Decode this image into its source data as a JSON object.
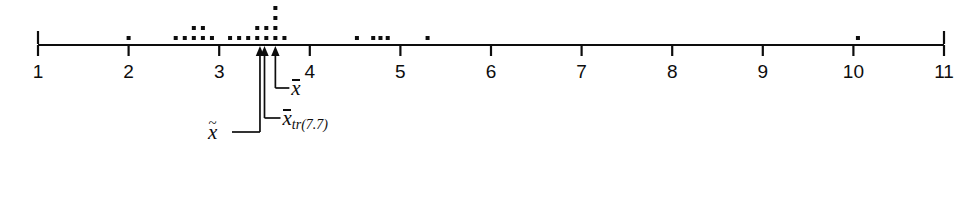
{
  "figure": {
    "type": "dotplot"
  },
  "axis": {
    "min": 1,
    "max": 11,
    "tick_labels": [
      "1",
      "2",
      "3",
      "4",
      "5",
      "6",
      "7",
      "8",
      "9",
      "10",
      "11"
    ],
    "tick_values": [
      1,
      2,
      3,
      4,
      5,
      6,
      7,
      8,
      9,
      10,
      11
    ],
    "color": "#0d0d0d"
  },
  "labels": {
    "mean": "x",
    "trimmed_mean": "x",
    "trimmed_mean_sub": "tr(7.7)",
    "median": "x"
  },
  "markers": [
    {
      "name": "median",
      "value": 3.45
    },
    {
      "name": "trimmed-mean",
      "value": 3.5
    },
    {
      "name": "mean",
      "value": 3.62
    }
  ],
  "chart_data": {
    "type": "scatter",
    "title": "",
    "xlabel": "",
    "ylabel": "",
    "xlim": [
      1,
      11
    ],
    "grid": false,
    "legend": null,
    "dot_stacks": [
      {
        "x": 2.0,
        "count": 1
      },
      {
        "x": 2.52,
        "count": 1
      },
      {
        "x": 2.62,
        "count": 1
      },
      {
        "x": 2.72,
        "count": 2
      },
      {
        "x": 2.82,
        "count": 2
      },
      {
        "x": 2.92,
        "count": 1
      },
      {
        "x": 3.12,
        "count": 1
      },
      {
        "x": 3.22,
        "count": 1
      },
      {
        "x": 3.32,
        "count": 1
      },
      {
        "x": 3.42,
        "count": 2
      },
      {
        "x": 3.52,
        "count": 2
      },
      {
        "x": 3.62,
        "count": 4
      },
      {
        "x": 3.72,
        "count": 1
      },
      {
        "x": 4.52,
        "count": 1
      },
      {
        "x": 4.7,
        "count": 1
      },
      {
        "x": 4.78,
        "count": 1
      },
      {
        "x": 4.86,
        "count": 1
      },
      {
        "x": 5.3,
        "count": 1
      },
      {
        "x": 10.05,
        "count": 1
      }
    ],
    "values": [
      2.0,
      2.52,
      2.62,
      2.72,
      2.72,
      2.82,
      2.82,
      2.92,
      3.12,
      3.22,
      3.32,
      3.42,
      3.42,
      3.52,
      3.52,
      3.62,
      3.62,
      3.62,
      3.62,
      3.72,
      4.52,
      4.7,
      4.78,
      4.86,
      5.3,
      10.05
    ]
  }
}
